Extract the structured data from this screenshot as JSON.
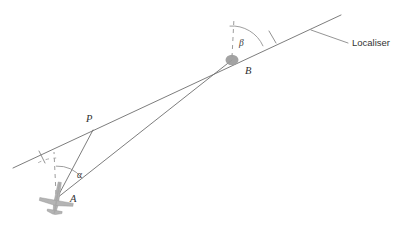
{
  "diagram": {
    "type": "geometry-diagram",
    "canvas": {
      "width": 411,
      "height": 229
    },
    "colors": {
      "line": "#6e6e6e",
      "dashed": "#8a8a8a",
      "arc": "#8c8c8c",
      "node": "#9b9b9b",
      "aircraft": "#b4b4b4",
      "text": "#2f2f2f",
      "background": "#ffffff"
    },
    "points": [
      {
        "id": "A",
        "label": "A",
        "x": 57,
        "y": 198,
        "label_x": 70,
        "label_y": 202,
        "marker": "aircraft"
      },
      {
        "id": "P",
        "label": "P",
        "x": 93,
        "y": 130,
        "label_x": 87,
        "label_y": 122,
        "marker": "none"
      },
      {
        "id": "B",
        "label": "B",
        "x": 232,
        "y": 60,
        "label_x": 245,
        "label_y": 74,
        "marker": "dot"
      }
    ],
    "angles": [
      {
        "id": "alpha",
        "label": "α",
        "vertex": "A",
        "label_x": 79,
        "label_y": 176,
        "from": "dashed-vertical-at-A",
        "to": "line-A-to-B"
      },
      {
        "id": "beta",
        "label": "β",
        "vertex": "B",
        "label_x": 238,
        "label_y": 45,
        "from": "dashed-vertical-at-B",
        "to": "localiser-line"
      }
    ],
    "callouts": [
      {
        "id": "localiser",
        "label": "Localiser",
        "text_x": 352,
        "text_y": 45,
        "leader_from_x": 311,
        "leader_from_y": 30,
        "leader_to_x": 348,
        "leader_to_y": 43
      }
    ],
    "segments": [
      {
        "id": "localiser-line",
        "name": "localiser-centreline",
        "x1": 13,
        "y1": 168,
        "x2": 341,
        "y2": 15,
        "style": "solid"
      },
      {
        "id": "line-A-B",
        "name": "aircraft-to-localiser-station",
        "x1": 57,
        "y1": 198,
        "x2": 232,
        "y2": 60,
        "style": "solid"
      },
      {
        "id": "line-A-P",
        "name": "aircraft-perpendicular-to-centreline",
        "x1": 57,
        "y1": 198,
        "x2": 93,
        "y2": 130,
        "style": "solid"
      }
    ],
    "dashed": [
      {
        "id": "vertical-at-A",
        "name": "north-reference-at-A",
        "x1": 57,
        "y1": 198,
        "x2": 55,
        "y2": 152,
        "style": "dashed"
      },
      {
        "id": "vertical-at-B",
        "name": "north-reference-at-B",
        "x1": 232,
        "y1": 60,
        "x2": 235,
        "y2": 18,
        "style": "dashed"
      }
    ],
    "ticks": [
      {
        "id": "tick-centreline-left",
        "x1": 39,
        "y1": 151,
        "x2": 45,
        "y2": 163
      },
      {
        "id": "tick-B-upper",
        "x1": 269,
        "y1": 31,
        "x2": 276,
        "y2": 43
      }
    ],
    "arcs": [
      {
        "id": "arc-alpha-solid",
        "vertex": "A",
        "radius": 32,
        "start_deg": -92,
        "end_deg": -38,
        "style": "solid"
      },
      {
        "id": "arc-alpha-dashed",
        "vertex": "A",
        "radius": 40,
        "start_deg": -118,
        "end_deg": -90,
        "style": "dashed"
      },
      {
        "id": "arc-beta-solid",
        "vertex": "B",
        "radius": 34,
        "start_deg": -94,
        "end_deg": -24,
        "style": "solid"
      }
    ]
  }
}
